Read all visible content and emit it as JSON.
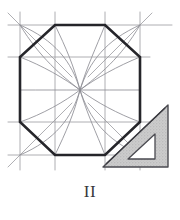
{
  "figure": {
    "caption": "II",
    "background_color": "#ffffff"
  },
  "colors": {
    "octagon_stroke": "#25252a",
    "construction_stroke": "#9a9aa0",
    "arc_stroke": "#8e8e95",
    "setsquare_fill": "#c9c9c9",
    "setsquare_stroke": "#4a4a50",
    "setsquare_cutout_fill": "#ffffff",
    "caption_color": "#38383c"
  },
  "chart_data": {
    "type": "diagram",
    "xlabel": "",
    "ylabel": "",
    "xlim": [
      0,
      180
    ],
    "ylim": [
      0,
      220
    ],
    "grid": false,
    "legend": "none",
    "elements": [
      {
        "name": "bounding-square",
        "kind": "polygon",
        "closed": true,
        "stroke": "#9a9aa0",
        "stroke_width": 0.9,
        "points": [
          [
            20,
            25
          ],
          [
            140,
            25
          ],
          [
            140,
            155
          ],
          [
            20,
            155
          ]
        ]
      },
      {
        "name": "octagon",
        "kind": "polygon",
        "closed": true,
        "stroke": "#25252a",
        "stroke_width": 2.6,
        "points": [
          [
            55,
            25
          ],
          [
            105,
            25
          ],
          [
            140,
            57
          ],
          [
            140,
            122
          ],
          [
            105,
            155
          ],
          [
            55,
            155
          ],
          [
            20,
            122
          ],
          [
            20,
            57
          ]
        ]
      }
    ],
    "construction_lines": [
      {
        "name": "grid-h-top",
        "x1": 8,
        "y1": 25,
        "x2": 172,
        "y2": 25
      },
      {
        "name": "grid-h-upper",
        "x1": 8,
        "y1": 57,
        "x2": 150,
        "y2": 57
      },
      {
        "name": "grid-h-lower",
        "x1": 8,
        "y1": 122,
        "x2": 150,
        "y2": 122
      },
      {
        "name": "grid-h-bottom",
        "x1": 8,
        "y1": 155,
        "x2": 150,
        "y2": 155
      },
      {
        "name": "grid-v-left",
        "x1": 20,
        "y1": 12,
        "x2": 20,
        "y2": 170
      },
      {
        "name": "grid-v-inner-left",
        "x1": 55,
        "y1": 12,
        "x2": 55,
        "y2": 170
      },
      {
        "name": "grid-v-inner-right",
        "x1": 105,
        "y1": 12,
        "x2": 105,
        "y2": 170
      },
      {
        "name": "grid-v-right",
        "x1": 140,
        "y1": 12,
        "x2": 140,
        "y2": 170
      },
      {
        "name": "corner-diag-tl",
        "x1": 8,
        "y1": 13,
        "x2": 72,
        "y2": 77
      },
      {
        "name": "corner-diag-tr",
        "x1": 152,
        "y1": 13,
        "x2": 88,
        "y2": 77
      },
      {
        "name": "corner-diag-bl",
        "x1": 8,
        "y1": 167,
        "x2": 72,
        "y2": 103
      },
      {
        "name": "corner-diag-br",
        "x1": 152,
        "y1": 167,
        "x2": 88,
        "y2": 103
      },
      {
        "name": "octagon-chord-tl",
        "x1": 20,
        "y1": 57,
        "x2": 55,
        "y2": 25
      },
      {
        "name": "octagon-chord-tr",
        "x1": 105,
        "y1": 25,
        "x2": 140,
        "y2": 57
      },
      {
        "name": "octagon-chord-bl",
        "x1": 20,
        "y1": 122,
        "x2": 55,
        "y2": 155
      },
      {
        "name": "octagon-chord-br",
        "x1": 105,
        "y1": 155,
        "x2": 140,
        "y2": 122
      }
    ],
    "arcs": {
      "center": [
        80,
        90
      ],
      "count": 16,
      "description": "Curved arcs sweeping from the square's perimeter into the central convergence point, forming a pinwheel rosette",
      "paths": [
        {
          "name": "arc-1",
          "d": "M 20 25 C 55 40 72 62 80 90"
        },
        {
          "name": "arc-2",
          "d": "M 55 25 C 66 48 74 66 80 90"
        },
        {
          "name": "arc-3",
          "d": "M 105 25 C 96 48 87 66 80 90"
        },
        {
          "name": "arc-4",
          "d": "M 140 25 C 106 40 89 62 80 90"
        },
        {
          "name": "arc-5",
          "d": "M 140 57 C 118 66 96 78 80 90"
        },
        {
          "name": "arc-6",
          "d": "M 140 90 C 120 90 98 90 80 90"
        },
        {
          "name": "arc-7",
          "d": "M 140 122 C 118 114 96 102 80 90"
        },
        {
          "name": "arc-8",
          "d": "M 140 155 C 106 140 89 118 80 90"
        },
        {
          "name": "arc-9",
          "d": "M 105 155 C 96 132 87 114 80 90"
        },
        {
          "name": "arc-10",
          "d": "M 55 155 C 66 132 74 114 80 90"
        },
        {
          "name": "arc-11",
          "d": "M 20 155 C 55 140 72 118 80 90"
        },
        {
          "name": "arc-12",
          "d": "M 20 122 C 43 114 64 102 80 90"
        },
        {
          "name": "arc-13",
          "d": "M 20 90 C 41 90 62 90 80 90"
        },
        {
          "name": "arc-14",
          "d": "M 20 57 C 43 66 64 78 80 90"
        },
        {
          "name": "arc-15",
          "d": "M 20 25 C 40 58 62 76 80 90"
        },
        {
          "name": "arc-16",
          "d": "M 140 25 C 121 58 98 76 80 90"
        }
      ]
    },
    "setsquare": {
      "name": "45-degree set-square",
      "outline": [
        [
          103,
          167
        ],
        [
          168,
          105
        ],
        [
          168,
          167
        ]
      ],
      "cutout": [
        [
          128,
          159
        ],
        [
          155,
          134
        ],
        [
          155,
          159
        ]
      ],
      "fill": "#c9c9c9",
      "stroke": "#4a4a50",
      "stroke_width": 1.4,
      "inner_rule_line": {
        "x1": 106,
        "y1": 164,
        "x2": 165,
        "y2": 108
      }
    }
  }
}
